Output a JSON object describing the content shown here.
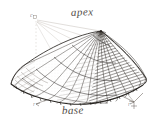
{
  "figure": {
    "kind": "engraving",
    "background_color": "#ffffff",
    "ink_color": "#3b3530",
    "shade_color": "#2b2622",
    "guide_color": "#b9b2aa",
    "labels": {
      "apex": "apex",
      "base": "base",
      "vertex_c": "c",
      "base_left_tick": "r",
      "base_right_tick": "r"
    },
    "geometry": {
      "apex_point": [
        101,
        31
      ],
      "base_left": [
        11,
        84
      ],
      "base_right": [
        146,
        78
      ],
      "base_front_low": [
        78,
        104
      ],
      "construction_vertex": [
        36,
        19
      ],
      "rib_count": 22,
      "arc_count": 5
    }
  }
}
